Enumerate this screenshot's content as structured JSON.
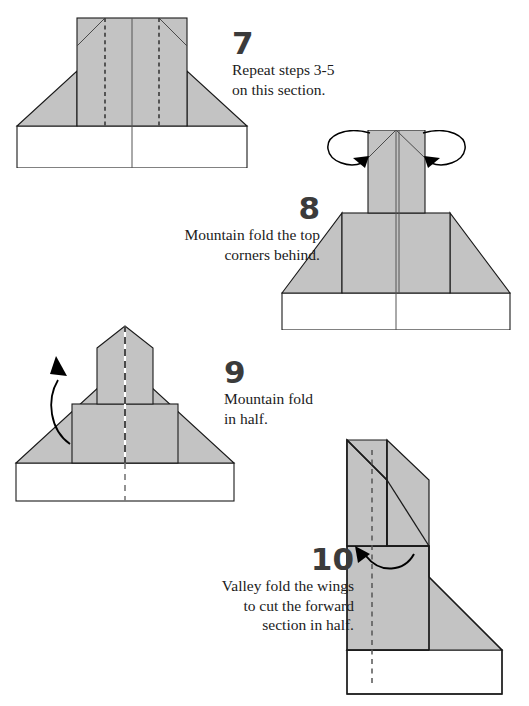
{
  "page": {
    "background_color": "#ffffff",
    "width": 529,
    "height": 706
  },
  "style": {
    "paper_fill": "#c3c3c3",
    "paper_fill_light": "#ffffff",
    "outline_color": "#1a1a1a",
    "crease_color": "#4a4a4a",
    "number_color": "#3b3b3b",
    "text_color": "#1b1b1b",
    "arrow_color": "#000000"
  },
  "steps": [
    {
      "number": "7",
      "text": "Repeat steps 3-5\non this section.",
      "align": "left",
      "caption_name": "step-7-caption",
      "diagram_name": "step-7-diagram",
      "fold_type": "valley",
      "fold_marks": 2,
      "view": "front"
    },
    {
      "number": "8",
      "text": "Mountain fold the top\ncorners behind.",
      "align": "right",
      "caption_name": "step-8-caption",
      "diagram_name": "step-8-diagram",
      "fold_type": "mountain",
      "fold_marks": 2,
      "view": "front"
    },
    {
      "number": "9",
      "text": "Mountain fold\nin half.",
      "align": "left",
      "caption_name": "step-9-caption",
      "diagram_name": "step-9-diagram",
      "fold_type": "mountain",
      "fold_marks": 1,
      "view": "front"
    },
    {
      "number": "10",
      "text": "Valley fold the wings\nto cut the forward\nsection in half.",
      "align": "right",
      "caption_name": "step-10-caption",
      "diagram_name": "step-10-diagram",
      "fold_type": "valley",
      "fold_marks": 1,
      "view": "side-profile"
    }
  ]
}
